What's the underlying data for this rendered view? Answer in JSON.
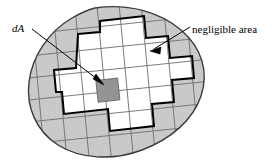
{
  "figure": {
    "name": "differential-area-element-diagram",
    "background_color": "#ffffff"
  },
  "labels": {
    "da": "dA",
    "negligible": "negligible area"
  },
  "colors": {
    "outside_sliver_fill": "#c9c9c9",
    "interior_fill": "#ffffff",
    "da_cell_fill": "#949494",
    "blob_outline": "#3b3b3b",
    "grid_line": "#6e6e6e",
    "staircase_line": "#000000",
    "leader_line": "#000000",
    "text": "#000000"
  },
  "geometry": {
    "grid_rotation_degrees": -6,
    "grid_cell_size_px": 22,
    "grid_columns": 8,
    "grid_rows": 6,
    "da_cell_column": 4,
    "da_cell_row": 3
  },
  "annotations": [
    {
      "name": "da-leader",
      "label_key": "da",
      "from": [
        40,
        31
      ],
      "to": [
        101,
        82
      ],
      "arrowhead": true
    },
    {
      "name": "negligible-leader",
      "label_key": "negligible",
      "from": [
        190,
        28
      ],
      "to": [
        152,
        50
      ],
      "arrowhead": true
    }
  ]
}
